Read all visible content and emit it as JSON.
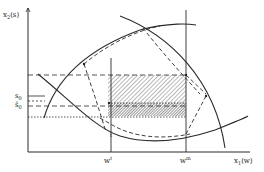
{
  "figure": {
    "axes": {
      "y_label": "x",
      "y_label_sub": "2",
      "y_label_arg": "(s)",
      "x_label": "x",
      "x_label_sub": "1",
      "x_label_arg": "(w)"
    },
    "ticks": {
      "w_low": "w",
      "w_low_sup": "ℓ",
      "w_high": "w",
      "w_high_sup": "m"
    },
    "y_markers": {
      "s0": "s",
      "s0_sub": "0",
      "s0_hat": "ŝ",
      "s0_hat_sub": "0"
    },
    "point_label": "t",
    "colors": {
      "line": "#2a2a2a",
      "hatch": "#555555",
      "background": "#ffffff"
    }
  }
}
